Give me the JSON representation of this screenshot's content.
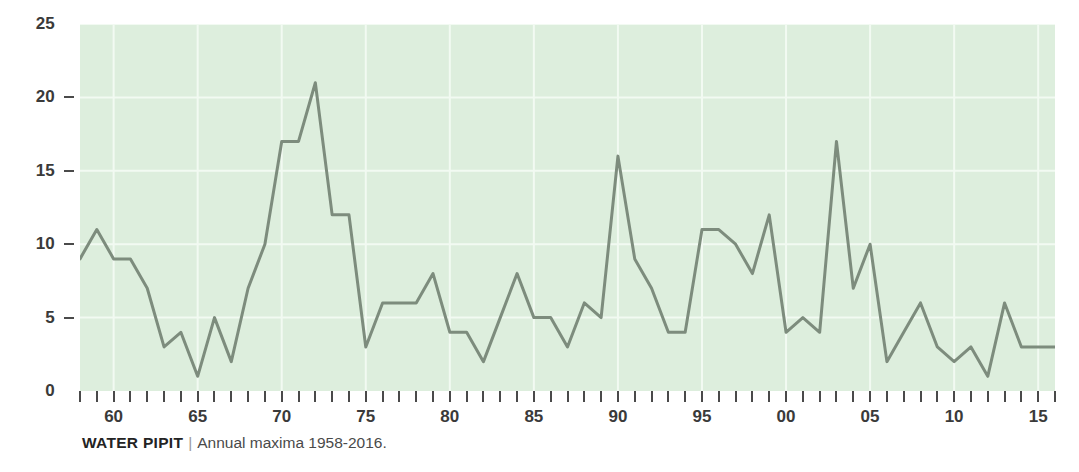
{
  "caption": {
    "title": "WATER PIPIT",
    "separator": "|",
    "subtitle": "Annual maxima 1958-2016."
  },
  "chart_data": {
    "type": "line",
    "title": "WATER PIPIT",
    "subtitle": "Annual maxima 1958-2016.",
    "xlabel": "",
    "ylabel": "",
    "xlim": [
      1958,
      2016
    ],
    "ylim": [
      0,
      25
    ],
    "yticks": [
      0,
      5,
      10,
      15,
      20,
      25
    ],
    "ytick_labels": [
      "0",
      "5",
      "10",
      "15",
      "20",
      "25"
    ],
    "xticks": [
      1960,
      1965,
      1970,
      1975,
      1980,
      1985,
      1990,
      1995,
      2000,
      2005,
      2010,
      2015
    ],
    "xtick_labels": [
      "60",
      "65",
      "70",
      "75",
      "80",
      "85",
      "90",
      "95",
      "00",
      "05",
      "10",
      "15"
    ],
    "grid": true,
    "legend": "none",
    "plot_bgcolor": "#ddeedd",
    "line_color": "#7d8c7d",
    "line_width": 3,
    "x": [
      1958,
      1959,
      1960,
      1961,
      1962,
      1963,
      1964,
      1965,
      1966,
      1967,
      1968,
      1969,
      1970,
      1971,
      1972,
      1973,
      1974,
      1975,
      1976,
      1977,
      1978,
      1979,
      1980,
      1981,
      1982,
      1983,
      1984,
      1985,
      1986,
      1987,
      1988,
      1989,
      1990,
      1991,
      1992,
      1993,
      1994,
      1995,
      1996,
      1997,
      1998,
      1999,
      2000,
      2001,
      2002,
      2003,
      2004,
      2005,
      2006,
      2007,
      2008,
      2009,
      2010,
      2011,
      2012,
      2013,
      2014,
      2015,
      2016
    ],
    "values": [
      9,
      11,
      9,
      9,
      7,
      3,
      4,
      1,
      5,
      2,
      7,
      10,
      17,
      17,
      21,
      12,
      12,
      3,
      6,
      6,
      6,
      8,
      4,
      4,
      2,
      5,
      8,
      5,
      5,
      3,
      6,
      5,
      16,
      9,
      7,
      4,
      4,
      11,
      11,
      10,
      8,
      12,
      4,
      5,
      4,
      17,
      7,
      10,
      2,
      4,
      6,
      3,
      2,
      3,
      1,
      6,
      3,
      3,
      3
    ],
    "series": [
      {
        "name": "Annual maxima",
        "values": [
          9,
          11,
          9,
          9,
          7,
          3,
          4,
          1,
          5,
          2,
          7,
          10,
          17,
          17,
          21,
          12,
          12,
          3,
          6,
          6,
          6,
          8,
          4,
          4,
          2,
          5,
          8,
          5,
          5,
          3,
          6,
          5,
          16,
          9,
          7,
          4,
          4,
          11,
          11,
          10,
          8,
          12,
          4,
          5,
          4,
          17,
          7,
          10,
          2,
          4,
          6,
          3,
          2,
          3,
          1,
          6,
          3,
          3,
          3
        ]
      }
    ]
  }
}
